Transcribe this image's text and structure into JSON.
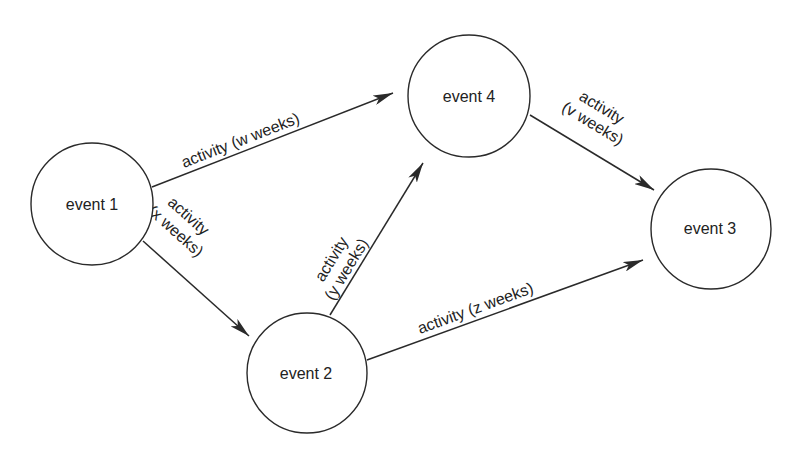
{
  "diagram": {
    "type": "activity-network",
    "nodes": [
      {
        "id": "event1",
        "label": "event 1"
      },
      {
        "id": "event2",
        "label": "event 2"
      },
      {
        "id": "event3",
        "label": "event 3"
      },
      {
        "id": "event4",
        "label": "event 4"
      }
    ],
    "edges": [
      {
        "from": "event1",
        "to": "event4",
        "label": "activity (w weeks)",
        "line1": "activity (w weeks)"
      },
      {
        "from": "event1",
        "to": "event2",
        "label": "activity (x weeks)",
        "line1": "activity",
        "line2": "(x weeks)"
      },
      {
        "from": "event2",
        "to": "event4",
        "label": "activity (y weeks)",
        "line1": "activity",
        "line2": "(y weeks)"
      },
      {
        "from": "event2",
        "to": "event3",
        "label": "activity (z weeks)",
        "line1": "activity (z weeks)"
      },
      {
        "from": "event4",
        "to": "event3",
        "label": "activity (v weeks)",
        "line1": "activity",
        "line2": "(v weeks)"
      }
    ]
  },
  "colors": {
    "stroke": "#2a2a2a",
    "text": "#222222",
    "background": "#ffffff"
  }
}
